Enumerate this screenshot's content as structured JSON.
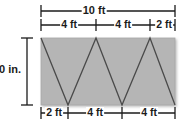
{
  "figure": {
    "type": "geometry-diagram",
    "colors": {
      "fill": "#b5b5b5",
      "stroke": "#4a4a4a",
      "dimension": "#1b1b1b",
      "background": "#ffffff"
    },
    "rectangle": {
      "width_label": "10 ft",
      "height_label": "60 in."
    },
    "dimensions": {
      "total_width": "10 ft",
      "height": "60 in.",
      "top_segments": [
        "4 ft",
        "4 ft",
        "2 ft"
      ],
      "bottom_segments": [
        "2 ft",
        "4 ft",
        "4 ft"
      ]
    },
    "labels": {
      "overall_width": "10 ft",
      "top_seg_1": "4 ft",
      "top_seg_2": "4 ft",
      "top_seg_3": "2 ft",
      "bottom_seg_1": "2 ft",
      "bottom_seg_2": "4 ft",
      "bottom_seg_3": "4 ft",
      "height": "60 in."
    }
  }
}
